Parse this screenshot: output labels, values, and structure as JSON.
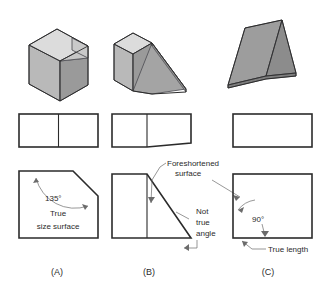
{
  "figure": {
    "background_color": "#ffffff",
    "line_color": "#2b2b2b",
    "leader_color": "#6b6b6b"
  },
  "shading": {
    "top_face": "#d9d9d9",
    "left_face": "#b9b9b9",
    "right_face": "#9a9a9a",
    "bevel_face": "#c6c6c6",
    "slope_face": "#a8a8a8",
    "edge": "#55555a"
  },
  "columns": [
    {
      "id": "a",
      "label": "(A)",
      "pictorial_name": "chamfered-block",
      "top_view_name": "top-view-divided-rectangle",
      "front_view_name": "front-view-chamfered-rectangle"
    },
    {
      "id": "b",
      "label": "(B)",
      "pictorial_name": "block-with-wedge",
      "top_view_name": "top-view-rectangle-with-trapezoid",
      "front_view_name": "front-view-rectangle-with-triangle"
    },
    {
      "id": "c",
      "label": "(C)",
      "pictorial_name": "triangular-wedge",
      "top_view_name": "top-view-plain-rectangle",
      "front_view_name": "front-view-plain-rectangle"
    }
  ],
  "annotations": {
    "angle_135": "135°",
    "true_size_line1": "True",
    "true_size_line2": "size surface",
    "foreshortened_line1": "Foreshortened",
    "foreshortened_line2": "surface",
    "not_true_angle_line1": "Not",
    "not_true_angle_line2": "true",
    "not_true_angle_line3": "angle",
    "angle_90": "90°",
    "true_length": "True length"
  }
}
